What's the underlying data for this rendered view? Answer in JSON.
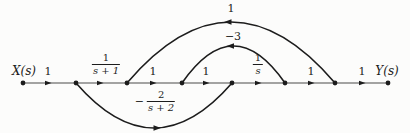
{
  "figure": {
    "type": "signal-flow-graph",
    "input": "X(s)",
    "output": "Y(s)",
    "stroke_color": "#1c1c1c",
    "background": "#fcfcfb"
  },
  "labels": {
    "input": "X(s)",
    "output": "Y(s)",
    "gain_x_n1": "1",
    "gain_n2_n3": "1",
    "gain_n3_n4": "1",
    "gain_n5_n6": "1",
    "gain_n6_y": "1",
    "arc_outer": "1",
    "arc_inner": "−3",
    "frac_s1": {
      "num": "1",
      "den": "s + 1"
    },
    "frac_s": {
      "num": "1",
      "den": "s"
    },
    "frac_s2": {
      "sign": "−",
      "num": "2",
      "den": "s + 2"
    }
  },
  "graph_data": {
    "nodes": [
      "X(s)",
      "n1",
      "n2",
      "n3",
      "n4",
      "n5",
      "n6",
      "Y(s)"
    ],
    "branches": [
      {
        "from": "X(s)",
        "to": "n1",
        "gain": "1",
        "shape": "line"
      },
      {
        "from": "n1",
        "to": "n2",
        "gain": "1/(s+1)",
        "shape": "line"
      },
      {
        "from": "n2",
        "to": "n3",
        "gain": "1",
        "shape": "line"
      },
      {
        "from": "n3",
        "to": "n4",
        "gain": "1",
        "shape": "line"
      },
      {
        "from": "n4",
        "to": "n5",
        "gain": "1/s",
        "shape": "line"
      },
      {
        "from": "n5",
        "to": "n6",
        "gain": "1",
        "shape": "line"
      },
      {
        "from": "n6",
        "to": "Y(s)",
        "gain": "1",
        "shape": "line"
      },
      {
        "from": "n1",
        "to": "n4",
        "gain": "-2/(s+2)",
        "shape": "bottom-arc"
      },
      {
        "from": "n5",
        "to": "n3",
        "gain": "-3",
        "shape": "inner-top-arc"
      },
      {
        "from": "n6",
        "to": "n2",
        "gain": "1",
        "shape": "outer-top-arc"
      }
    ]
  }
}
